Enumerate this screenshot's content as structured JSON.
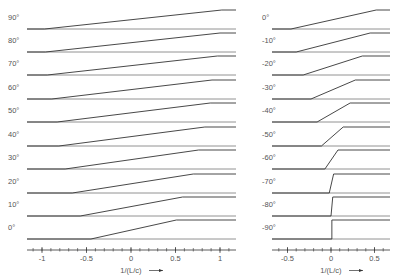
{
  "chart_data": [
    {
      "type": "line",
      "panel": "left",
      "title": "",
      "xlabel": "1/(L/c)",
      "xlabel_arrow": "→",
      "ylabel": "",
      "xlim": [
        -1.1,
        1.1
      ],
      "x_ticks": [
        -1,
        -0.5,
        0,
        0.5,
        1
      ],
      "x_tick_labels": [
        "-1",
        "-0.5",
        "0",
        "0.5",
        "1"
      ],
      "minor_tick_step": 0.1,
      "grid": false,
      "legend": "none",
      "row_labels": [
        "90°",
        "80°",
        "70°",
        "60°",
        "50°",
        "40°",
        "30°",
        "20°",
        "10°",
        "0°"
      ],
      "series": [
        {
          "name": "90°",
          "ramp_start": -0.97,
          "ramp_end": 1.02
        },
        {
          "name": "80°",
          "ramp_start": -0.96,
          "ramp_end": 1.0
        },
        {
          "name": "70°",
          "ramp_start": -0.94,
          "ramp_end": 0.97
        },
        {
          "name": "60°",
          "ramp_start": -0.89,
          "ramp_end": 0.91
        },
        {
          "name": "50°",
          "ramp_start": -0.83,
          "ramp_end": 0.89
        },
        {
          "name": "40°",
          "ramp_start": -0.81,
          "ramp_end": 0.83
        },
        {
          "name": "30°",
          "ramp_start": -0.74,
          "ramp_end": 0.76
        },
        {
          "name": "20°",
          "ramp_start": -0.66,
          "ramp_end": 0.7
        },
        {
          "name": "10°",
          "ramp_start": -0.57,
          "ramp_end": 0.58
        },
        {
          "name": "0°",
          "ramp_start": -0.45,
          "ramp_end": 0.51
        }
      ]
    },
    {
      "type": "line",
      "panel": "right",
      "title": "",
      "xlabel": "1/(L/c)",
      "xlabel_arrow": "→",
      "ylabel": "",
      "xlim": [
        -0.68,
        0.68
      ],
      "x_ticks": [
        -0.5,
        0,
        0.5
      ],
      "x_tick_labels": [
        "-0.5",
        "0",
        "0.5"
      ],
      "minor_tick_step": 0.1,
      "grid": false,
      "legend": "none",
      "row_labels": [
        "0°",
        "-10°",
        "-20°",
        "-30°",
        "-40°",
        "-50°",
        "-60°",
        "-70°",
        "-80°",
        "-90°"
      ],
      "series": [
        {
          "name": "0°",
          "ramp_start": -0.46,
          "ramp_end": 0.52
        },
        {
          "name": "-10°",
          "ramp_start": -0.4,
          "ramp_end": 0.45
        },
        {
          "name": "-20°",
          "ramp_start": -0.32,
          "ramp_end": 0.36
        },
        {
          "name": "-30°",
          "ramp_start": -0.23,
          "ramp_end": 0.28
        },
        {
          "name": "-40°",
          "ramp_start": -0.16,
          "ramp_end": 0.22
        },
        {
          "name": "-50°",
          "ramp_start": -0.11,
          "ramp_end": 0.14
        },
        {
          "name": "-60°",
          "ramp_start": -0.07,
          "ramp_end": 0.08
        },
        {
          "name": "-70°",
          "ramp_start": -0.02,
          "ramp_end": 0.03
        },
        {
          "name": "-80°",
          "ramp_start": 0.0,
          "ramp_end": 0.02
        },
        {
          "name": "-90°",
          "ramp_start": 0.01,
          "ramp_end": 0.01
        }
      ]
    }
  ],
  "colors": {
    "line": "#333333",
    "baseline": "#777777",
    "text": "#555555"
  }
}
